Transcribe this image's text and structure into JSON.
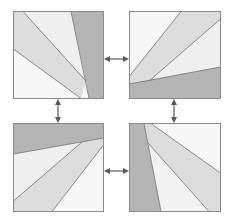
{
  "diagram": {
    "colors": {
      "background": "#ffffff",
      "border": "#8a8a8a",
      "dark": "#b4b4b4",
      "mid": "#dcdcdc",
      "light": "#efefef",
      "lightest": "#f7f7f7",
      "line": "#6e6e6e",
      "arrow": "#5a5a5a"
    },
    "panels": [
      {
        "id": "top-left",
        "x": 13,
        "y": 11,
        "size": 90
      },
      {
        "id": "top-right",
        "x": 129,
        "y": 11,
        "size": 90
      },
      {
        "id": "bottom-left",
        "x": 13,
        "y": 123,
        "size": 90
      },
      {
        "id": "bottom-right",
        "x": 129,
        "y": 123,
        "size": 90
      }
    ],
    "arrows": [
      {
        "id": "top-horizontal",
        "from": "top-left",
        "to": "top-right",
        "orientation": "horizontal"
      },
      {
        "id": "left-vertical",
        "from": "top-left",
        "to": "bottom-left",
        "orientation": "vertical"
      },
      {
        "id": "right-vertical",
        "from": "top-right",
        "to": "bottom-right",
        "orientation": "vertical"
      },
      {
        "id": "bottom-horizontal",
        "from": "bottom-left",
        "to": "bottom-right",
        "orientation": "horizontal"
      }
    ]
  }
}
